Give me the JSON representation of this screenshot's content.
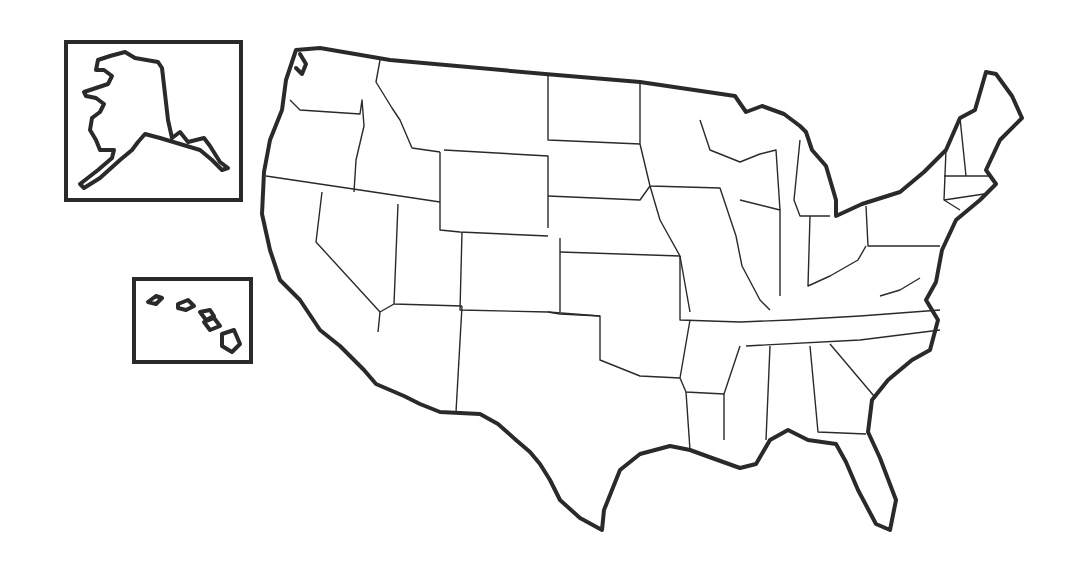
{
  "map": {
    "title": "",
    "type": "blank outline map",
    "subject": "United States",
    "insets": [
      {
        "name": "Alaska inset",
        "position": "top-left"
      },
      {
        "name": "Hawaii inset",
        "position": "left-middle"
      }
    ],
    "labels": [],
    "colors": {
      "stroke": "#2a2a2a",
      "background": "#ffffff"
    }
  }
}
